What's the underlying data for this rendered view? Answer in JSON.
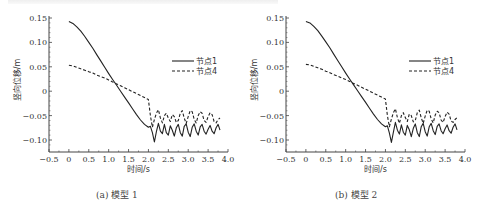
{
  "chart_data": [
    {
      "type": "line",
      "title": "",
      "caption": "(a) 模型 1",
      "xlabel": "时间/s",
      "ylabel": "竖向位移/m",
      "xlim": [
        -0.5,
        4.0
      ],
      "ylim": [
        -0.125,
        0.155
      ],
      "xticks": [
        "-0.5",
        "0",
        "0.5",
        "1.0",
        "1.5",
        "2.0",
        "2.5",
        "3.0",
        "3.5",
        "4.0"
      ],
      "yticks": [
        "0.15",
        "0.10",
        "0.05",
        "0",
        "-0.05",
        "-0.10"
      ],
      "grid": false,
      "legend_position": "upper right",
      "series": [
        {
          "name": "节点1",
          "style": "solid",
          "x": [
            0,
            0.1,
            0.2,
            0.3,
            0.4,
            0.5,
            0.6,
            0.7,
            0.8,
            0.9,
            1.0,
            1.1,
            1.2,
            1.3,
            1.4,
            1.5,
            1.6,
            1.7,
            1.8,
            1.9,
            2.0,
            2.05,
            2.1,
            2.15,
            2.2,
            2.25,
            2.3,
            2.35,
            2.4,
            2.45,
            2.5,
            2.55,
            2.6,
            2.65,
            2.7,
            2.75,
            2.8,
            2.85,
            2.9,
            2.95,
            3.0,
            3.05,
            3.1,
            3.15,
            3.2,
            3.25,
            3.3,
            3.35,
            3.4,
            3.45,
            3.5,
            3.55,
            3.6,
            3.65,
            3.7,
            3.75,
            3.8
          ],
          "y": [
            0.143,
            0.139,
            0.132,
            0.123,
            0.112,
            0.1,
            0.088,
            0.075,
            0.062,
            0.049,
            0.036,
            0.024,
            0.012,
            0.0,
            -0.012,
            -0.024,
            -0.036,
            -0.048,
            -0.059,
            -0.068,
            -0.074,
            -0.072,
            -0.085,
            -0.104,
            -0.083,
            -0.066,
            -0.082,
            -0.087,
            -0.068,
            -0.085,
            -0.09,
            -0.071,
            -0.08,
            -0.092,
            -0.075,
            -0.068,
            -0.085,
            -0.092,
            -0.072,
            -0.067,
            -0.084,
            -0.093,
            -0.074,
            -0.067,
            -0.082,
            -0.09,
            -0.073,
            -0.068,
            -0.082,
            -0.088,
            -0.078,
            -0.07,
            -0.082,
            -0.087,
            -0.075,
            -0.068,
            -0.08
          ]
        },
        {
          "name": "节点4",
          "style": "dashed",
          "x": [
            0,
            0.1,
            0.2,
            0.3,
            0.4,
            0.5,
            0.6,
            0.7,
            0.8,
            0.9,
            1.0,
            1.1,
            1.2,
            1.3,
            1.4,
            1.5,
            1.6,
            1.7,
            1.8,
            1.9,
            2.0,
            2.05,
            2.1,
            2.15,
            2.2,
            2.25,
            2.3,
            2.35,
            2.4,
            2.45,
            2.5,
            2.55,
            2.6,
            2.65,
            2.7,
            2.75,
            2.8,
            2.85,
            2.9,
            2.95,
            3.0,
            3.05,
            3.1,
            3.15,
            3.2,
            3.25,
            3.3,
            3.35,
            3.4,
            3.45,
            3.5,
            3.55,
            3.6,
            3.65,
            3.7,
            3.75,
            3.8
          ],
          "y": [
            0.053,
            0.052,
            0.049,
            0.046,
            0.043,
            0.04,
            0.037,
            0.033,
            0.03,
            0.027,
            0.023,
            0.019,
            0.015,
            0.011,
            0.007,
            0.003,
            -0.001,
            -0.005,
            -0.009,
            -0.013,
            -0.017,
            -0.05,
            -0.074,
            -0.058,
            -0.045,
            -0.038,
            -0.055,
            -0.065,
            -0.05,
            -0.045,
            -0.055,
            -0.062,
            -0.048,
            -0.052,
            -0.064,
            -0.06,
            -0.045,
            -0.04,
            -0.055,
            -0.066,
            -0.052,
            -0.04,
            -0.042,
            -0.058,
            -0.065,
            -0.05,
            -0.042,
            -0.045,
            -0.06,
            -0.064,
            -0.052,
            -0.044,
            -0.048,
            -0.062,
            -0.065,
            -0.058,
            -0.055
          ]
        }
      ]
    },
    {
      "type": "line",
      "title": "",
      "caption": "(b) 模型 2",
      "xlabel": "时间/s",
      "ylabel": "竖向位移/m",
      "xlim": [
        -0.5,
        4.0
      ],
      "ylim": [
        -0.125,
        0.155
      ],
      "xticks": [
        "-0.5",
        "0",
        "0.5",
        "1.0",
        "1.5",
        "2.0",
        "2.5",
        "3.0",
        "3.5",
        "4.0"
      ],
      "yticks": [
        "0.15",
        "0.10",
        "0.05",
        "0",
        "-0.05",
        "-0.10"
      ],
      "grid": false,
      "legend_position": "upper right",
      "series": [
        {
          "name": "节点1",
          "style": "solid",
          "x": [
            0,
            0.1,
            0.2,
            0.3,
            0.4,
            0.5,
            0.6,
            0.7,
            0.8,
            0.9,
            1.0,
            1.1,
            1.2,
            1.3,
            1.4,
            1.5,
            1.6,
            1.7,
            1.8,
            1.9,
            2.0,
            2.05,
            2.1,
            2.15,
            2.2,
            2.25,
            2.3,
            2.35,
            2.4,
            2.45,
            2.5,
            2.55,
            2.6,
            2.65,
            2.7,
            2.75,
            2.8,
            2.85,
            2.9,
            2.95,
            3.0,
            3.05,
            3.1,
            3.15,
            3.2,
            3.25,
            3.3,
            3.35,
            3.4,
            3.45,
            3.5,
            3.55,
            3.6,
            3.65,
            3.7,
            3.75,
            3.8
          ],
          "y": [
            0.143,
            0.14,
            0.133,
            0.124,
            0.113,
            0.101,
            0.089,
            0.076,
            0.063,
            0.05,
            0.037,
            0.025,
            0.013,
            0.001,
            -0.011,
            -0.023,
            -0.035,
            -0.047,
            -0.058,
            -0.067,
            -0.073,
            -0.071,
            -0.086,
            -0.105,
            -0.084,
            -0.064,
            -0.08,
            -0.088,
            -0.069,
            -0.084,
            -0.09,
            -0.07,
            -0.079,
            -0.093,
            -0.076,
            -0.067,
            -0.085,
            -0.093,
            -0.073,
            -0.066,
            -0.083,
            -0.092,
            -0.073,
            -0.066,
            -0.081,
            -0.089,
            -0.072,
            -0.067,
            -0.081,
            -0.087,
            -0.077,
            -0.069,
            -0.081,
            -0.086,
            -0.074,
            -0.067,
            -0.079
          ]
        },
        {
          "name": "节点4",
          "style": "dashed",
          "x": [
            0,
            0.1,
            0.2,
            0.3,
            0.4,
            0.5,
            0.6,
            0.7,
            0.8,
            0.9,
            1.0,
            1.1,
            1.2,
            1.3,
            1.4,
            1.5,
            1.6,
            1.7,
            1.8,
            1.9,
            2.0,
            2.05,
            2.1,
            2.15,
            2.2,
            2.25,
            2.3,
            2.35,
            2.4,
            2.45,
            2.5,
            2.55,
            2.6,
            2.65,
            2.7,
            2.75,
            2.8,
            2.85,
            2.9,
            2.95,
            3.0,
            3.05,
            3.1,
            3.15,
            3.2,
            3.25,
            3.3,
            3.35,
            3.4,
            3.45,
            3.5,
            3.55,
            3.6,
            3.65,
            3.7,
            3.75,
            3.8
          ],
          "y": [
            0.055,
            0.054,
            0.051,
            0.048,
            0.045,
            0.041,
            0.038,
            0.034,
            0.031,
            0.027,
            0.024,
            0.02,
            0.016,
            0.012,
            0.008,
            0.004,
            0.0,
            -0.004,
            -0.008,
            -0.012,
            -0.016,
            -0.05,
            -0.073,
            -0.057,
            -0.044,
            -0.036,
            -0.054,
            -0.066,
            -0.05,
            -0.044,
            -0.054,
            -0.062,
            -0.047,
            -0.05,
            -0.063,
            -0.06,
            -0.044,
            -0.039,
            -0.054,
            -0.066,
            -0.051,
            -0.039,
            -0.041,
            -0.057,
            -0.065,
            -0.049,
            -0.041,
            -0.044,
            -0.059,
            -0.064,
            -0.052,
            -0.043,
            -0.047,
            -0.061,
            -0.064,
            -0.058,
            -0.054
          ]
        }
      ]
    }
  ],
  "layout": {
    "plots": [
      {
        "x0": 49,
        "x1": 228,
        "y_top": 18,
        "y_bottom": 152,
        "legend": {
          "x": 172,
          "y1": 61,
          "y2": 71
        }
      },
      {
        "x0": 286,
        "x1": 465,
        "y_top": 18,
        "y_bottom": 152,
        "legend": {
          "x": 409,
          "y1": 61,
          "y2": 71
        }
      }
    ]
  },
  "captions": {
    "a": "(a) 模型 1",
    "b": "(b) 模型 2"
  }
}
